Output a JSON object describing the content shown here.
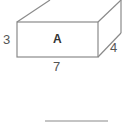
{
  "diagram": {
    "box": {
      "face_label": "A",
      "height_label": "3",
      "length_label": "7",
      "depth_label": "4"
    },
    "colors": {
      "stroke": "#8a8a8a",
      "text": "#555555"
    }
  }
}
